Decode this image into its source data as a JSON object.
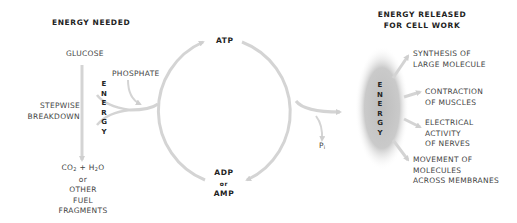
{
  "headings": {
    "energy_needed": "ENERGY NEEDED",
    "energy_released_line1": "ENERGY RELEASED",
    "energy_released_line2": "FOR CELL WORK"
  },
  "left": {
    "glucose": "GLUCOSE",
    "phosphate": "PHOSPHATE",
    "stepwise": "STEPWISE",
    "breakdown": "BREAKDOWN",
    "energy_letters": [
      "E",
      "N",
      "E",
      "R",
      "G",
      "Y"
    ],
    "products": {
      "co2": "CO",
      "co2_sub": "2",
      "plus": " + H",
      "h2o_sub": "2",
      "o": "O",
      "or": "or",
      "other": "OTHER",
      "fuel": "FUEL",
      "fragments": "FRAGMENTS"
    }
  },
  "cycle": {
    "atp": "ATP",
    "adp": "ADP",
    "or": "or",
    "amp": "AMP",
    "pi": "P",
    "pi_sub": "i"
  },
  "right": {
    "energy_letters": [
      "E",
      "N",
      "E",
      "R",
      "G",
      "Y"
    ],
    "outputs": [
      {
        "line1": "SYNTHESIS OF",
        "line2": "LARGE MOLECULE"
      },
      {
        "line1": "CONTRACTION",
        "line2": "OF MUSCLES"
      },
      {
        "line1": "ELECTRICAL",
        "line2": "ACTIVITY",
        "line3": "OF NERVES"
      },
      {
        "line1": "MOVEMENT OF",
        "line2": "MOLECULES",
        "line3": "ACROSS MEMBRANES"
      }
    ]
  },
  "colors": {
    "arrow": "#d4d4d4",
    "energy_cloud": "#c8c8c8",
    "text": "#444444"
  }
}
